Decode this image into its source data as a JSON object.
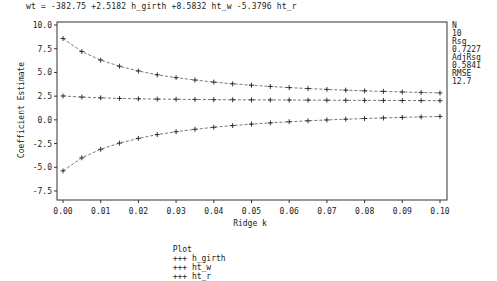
{
  "chart_data": {
    "type": "line",
    "title": "wt = -382.75 +2.5182 h_girth +8.5832 ht_w -5.3796 ht_r",
    "xlabel": "Ridge k",
    "ylabel": "Coefficient Estimate",
    "xlim": [
      0.0,
      0.1
    ],
    "ylim": [
      -7.5,
      10.0
    ],
    "x_ticks": [
      "0.00",
      "0.01",
      "0.02",
      "0.03",
      "0.04",
      "0.05",
      "0.06",
      "0.07",
      "0.08",
      "0.09",
      "0.10"
    ],
    "y_ticks": [
      "10.0",
      "7.5",
      "5.0",
      "2.5",
      "0.0",
      "-2.5",
      "-5.0",
      "-7.5"
    ],
    "grid": false,
    "legend_position": "bottom",
    "legend_label": "Plot",
    "x": [
      0.0,
      0.005,
      0.01,
      0.015,
      0.02,
      0.025,
      0.03,
      0.035,
      0.04,
      0.045,
      0.05,
      0.055,
      0.06,
      0.065,
      0.07,
      0.075,
      0.08,
      0.085,
      0.09,
      0.095,
      0.1
    ],
    "series": [
      {
        "name": "h_girth",
        "values": [
          2.52,
          2.4,
          2.32,
          2.26,
          2.22,
          2.19,
          2.17,
          2.15,
          2.13,
          2.12,
          2.11,
          2.1,
          2.09,
          2.08,
          2.07,
          2.06,
          2.05,
          2.05,
          2.04,
          2.03,
          2.02
        ]
      },
      {
        "name": "ht_w",
        "values": [
          8.58,
          7.2,
          6.3,
          5.65,
          5.15,
          4.75,
          4.45,
          4.2,
          3.98,
          3.8,
          3.65,
          3.52,
          3.4,
          3.3,
          3.21,
          3.13,
          3.06,
          3.0,
          2.94,
          2.89,
          2.84
        ]
      },
      {
        "name": "ht_r",
        "values": [
          -5.38,
          -4.0,
          -3.1,
          -2.45,
          -1.95,
          -1.55,
          -1.25,
          -1.0,
          -0.78,
          -0.6,
          -0.45,
          -0.32,
          -0.2,
          -0.1,
          -0.01,
          0.07,
          0.14,
          0.2,
          0.26,
          0.31,
          0.36
        ]
      }
    ],
    "stats": [
      {
        "label": "N",
        "value": "10"
      },
      {
        "label": "Rsq",
        "value": "0.7227"
      },
      {
        "label": "AdjRsq",
        "value": "0.5841"
      },
      {
        "label": "RMSE",
        "value": "12.7"
      }
    ]
  },
  "legend": {
    "label": "Plot",
    "items": [
      "+++ h_girth",
      "+++ ht_w",
      "+++ ht_r"
    ]
  }
}
